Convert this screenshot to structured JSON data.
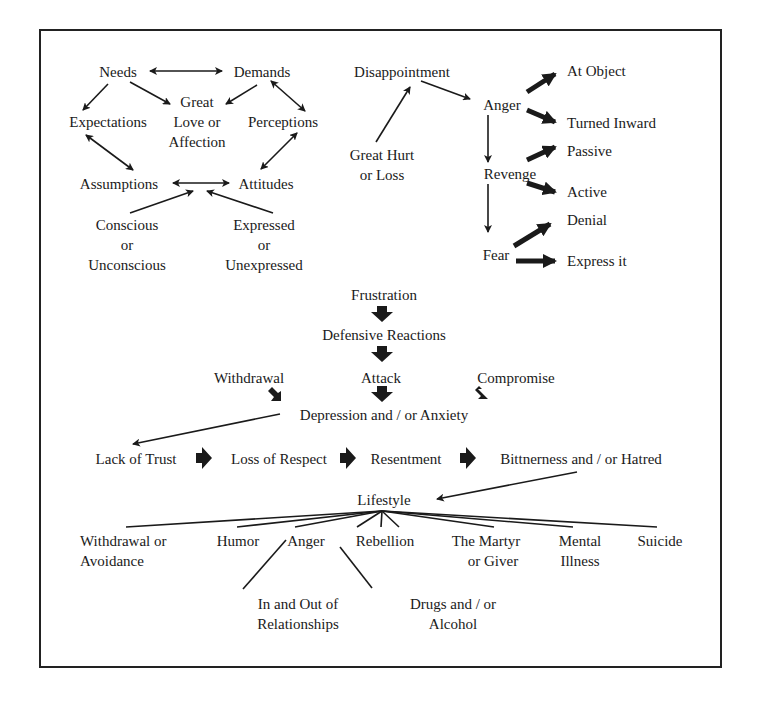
{
  "diagram": {
    "cluster_expectations": {
      "needs": "Needs",
      "demands": "Demands",
      "great_love_1": "Great",
      "great_love_2": "Love or",
      "great_love_3": "Affection",
      "expectations": "Expectations",
      "perceptions": "Perceptions",
      "assumptions": "Assumptions",
      "attitudes": "Attitudes",
      "conscious_1": "Conscious",
      "conscious_2": "or",
      "conscious_3": "Unconscious",
      "expressed_1": "Expressed",
      "expressed_2": "or",
      "expressed_3": "Unexpressed"
    },
    "cluster_anger": {
      "disappointment": "Disappointment",
      "great_hurt_1": "Great Hurt",
      "great_hurt_2": "or Loss",
      "anger": "Anger",
      "at_object": "At Object",
      "turned_inward": "Turned Inward",
      "revenge": "Revenge",
      "passive": "Passive",
      "active": "Active",
      "fear": "Fear",
      "denial": "Denial",
      "express_it": "Express it"
    },
    "center_flow": {
      "frustration": "Frustration",
      "defensive_reactions": "Defensive Reactions",
      "withdrawal": "Withdrawal",
      "attack": "Attack",
      "compromise": "Compromise",
      "depression": "Depression and / or Anxiety"
    },
    "chain": {
      "lack_of_trust": "Lack of Trust",
      "loss_of_respect": "Loss of Respect",
      "resentment": "Resentment",
      "bitterness": "Bittnerness and / or Hatred"
    },
    "lifestyle": {
      "title": "Lifestyle",
      "outcomes": {
        "withdrawal_1": "Withdrawal or",
        "withdrawal_2": "Avoidance",
        "humor": "Humor",
        "anger": "Anger",
        "rebellion": "Rebellion",
        "martyr_1": "The Martyr",
        "martyr_2": "or Giver",
        "mental_1": "Mental",
        "mental_2": "Illness",
        "suicide": "Suicide",
        "relationships_1": "In and Out of",
        "relationships_2": "Relationships",
        "drugs_1": "Drugs and / or",
        "drugs_2": "Alcohol"
      }
    }
  }
}
